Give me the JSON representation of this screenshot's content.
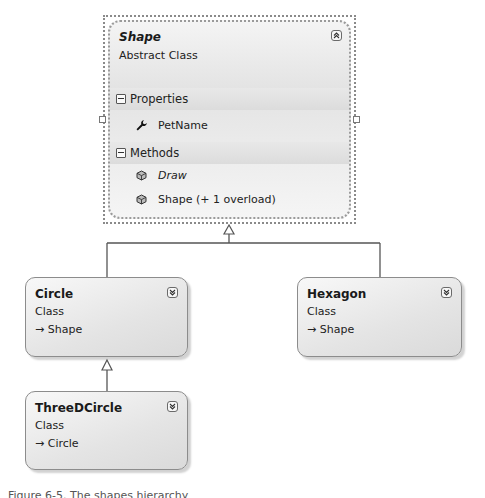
{
  "diagram": {
    "type": "class-diagram",
    "classes": [
      {
        "name": "Shape",
        "kind": "Abstract Class",
        "selected": true,
        "toggle_icon": "collapse-up-icon",
        "sections": [
          {
            "label": "Properties",
            "members": [
              {
                "name": "PetName",
                "icon": "wrench-icon",
                "italic": false
              }
            ]
          },
          {
            "label": "Methods",
            "members": [
              {
                "name": "Draw",
                "icon": "method-cube-icon",
                "italic": true
              },
              {
                "name": "Shape (+ 1 overload)",
                "icon": "method-cube-icon",
                "italic": false
              }
            ]
          }
        ]
      },
      {
        "name": "Circle",
        "kind": "Class",
        "inherits": "Shape",
        "toggle_icon": "expand-down-icon"
      },
      {
        "name": "Hexagon",
        "kind": "Class",
        "inherits": "Shape",
        "toggle_icon": "expand-down-icon"
      },
      {
        "name": "ThreeDCircle",
        "kind": "Class",
        "inherits": "Circle",
        "toggle_icon": "expand-down-icon"
      }
    ],
    "relationships": [
      {
        "from": "Circle",
        "to": "Shape",
        "type": "inheritance"
      },
      {
        "from": "Hexagon",
        "to": "Shape",
        "type": "inheritance"
      },
      {
        "from": "ThreeDCircle",
        "to": "Circle",
        "type": "inheritance"
      }
    ],
    "inherit_arrow_glyph": "→"
  },
  "caption": "Figure 6-5. The shapes hierarchy"
}
